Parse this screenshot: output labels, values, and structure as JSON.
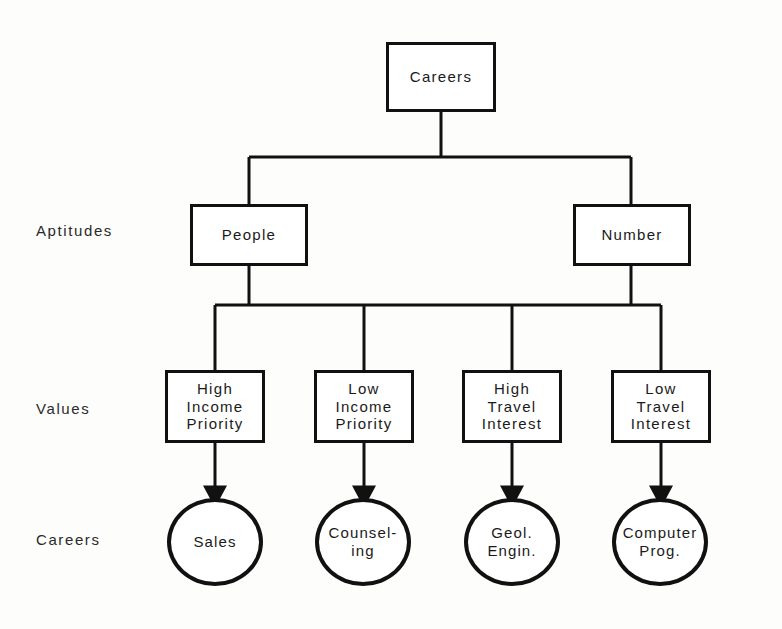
{
  "diagram": {
    "background_color": "#fdfdfb",
    "line_color": "#111111",
    "text_color": "#1a1a1a",
    "row_labels": [
      {
        "id": "aptitudes",
        "text": "Aptitudes"
      },
      {
        "id": "values",
        "text": "Values"
      },
      {
        "id": "careers",
        "text": "Careers"
      }
    ],
    "root": {
      "label": "Careers",
      "shape": "rectangle"
    },
    "aptitudes": [
      {
        "label": "People",
        "shape": "rectangle"
      },
      {
        "label": "Number",
        "shape": "rectangle"
      }
    ],
    "values": [
      {
        "shape": "rectangle",
        "lines": [
          "High",
          "Income",
          "Priority"
        ]
      },
      {
        "shape": "rectangle",
        "lines": [
          "Low",
          "Income",
          "Priority"
        ]
      },
      {
        "shape": "rectangle",
        "lines": [
          "High",
          "Travel",
          "Interest"
        ]
      },
      {
        "shape": "rectangle",
        "lines": [
          "Low",
          "Travel",
          "Interest"
        ]
      }
    ],
    "careers": [
      {
        "shape": "ellipse",
        "lines": [
          "Sales"
        ]
      },
      {
        "shape": "ellipse",
        "lines": [
          "Counsel-",
          "ing"
        ]
      },
      {
        "shape": "ellipse",
        "lines": [
          "Geol.",
          "Engin."
        ]
      },
      {
        "shape": "ellipse",
        "lines": [
          "Computer",
          "Prog."
        ]
      }
    ],
    "edges": {
      "root_to_aptitudes": "plain",
      "aptitudes_to_values": "plain",
      "values_to_careers": "arrow"
    }
  }
}
